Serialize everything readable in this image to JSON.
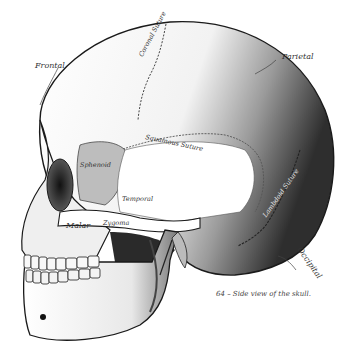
{
  "figure": {
    "caption": "64 – Side view of the skull.",
    "colors": {
      "background": "#ffffff",
      "ink": "#1a1a1a",
      "shade_dark": "#3a3a3a",
      "shade_mid": "#8a8a8a",
      "shade_light": "#d6d6d6",
      "label": "#333333"
    },
    "labels": {
      "frontal": "Frontal",
      "parietal": "Parietal",
      "coronal_suture": "Coronal Suture",
      "squamous_suture": "Squamous Suture",
      "sphenoid": "Sphenoid",
      "temporal": "Temporal",
      "malar": "Malar",
      "zygoma": "Zygoma",
      "lambdoid_suture": "Lambdoid Suture",
      "occipital": "Occipital"
    }
  }
}
